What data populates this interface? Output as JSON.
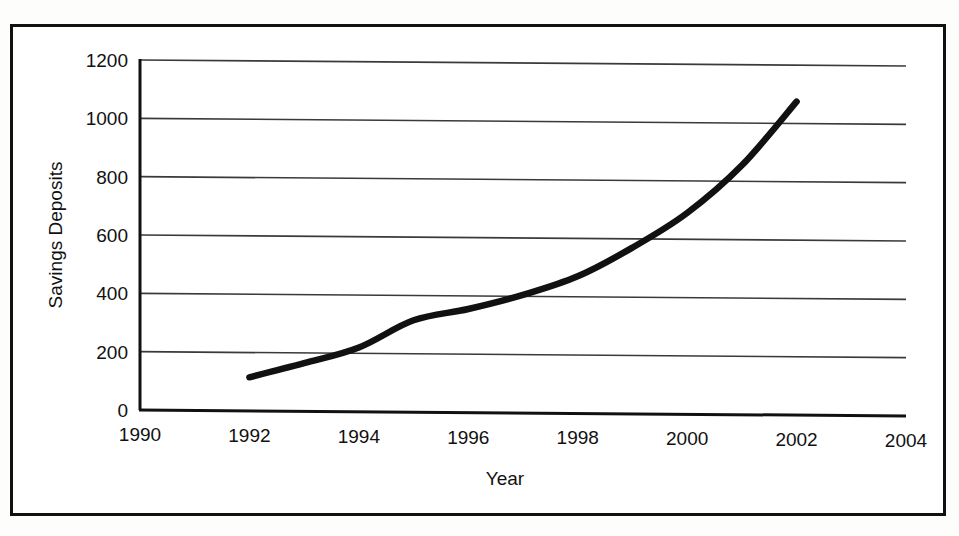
{
  "figure": {
    "background_color": "#ffffff",
    "border_color": "#111111",
    "line_color": "#111111",
    "gridline_color": "#3a3a3a"
  },
  "chart_data": {
    "type": "line",
    "title": "",
    "xlabel": "Year",
    "ylabel": "Savings Deposits",
    "xlim": [
      1990,
      2004
    ],
    "ylim": [
      0,
      1200
    ],
    "xticks": [
      1990,
      1992,
      1994,
      1996,
      1998,
      2000,
      2002,
      2004
    ],
    "xtick_labels": [
      "1990",
      "1992",
      "1994",
      "1996",
      "1998",
      "2000",
      "2002",
      "2004"
    ],
    "yticks": [
      0,
      200,
      400,
      600,
      800,
      1000,
      1200
    ],
    "ytick_labels": [
      "0",
      "200",
      "400",
      "600",
      "800",
      "1000",
      "1200"
    ],
    "grid": "horizontal",
    "legend": "none",
    "series": [
      {
        "name": "Savings Deposits",
        "x": [
          1992,
          1993,
          1994,
          1995,
          1996,
          1997,
          1998,
          1999,
          2000,
          2001,
          2002
        ],
        "values": [
          115,
          165,
          220,
          315,
          355,
          405,
          470,
          570,
          690,
          855,
          1075
        ]
      }
    ]
  }
}
